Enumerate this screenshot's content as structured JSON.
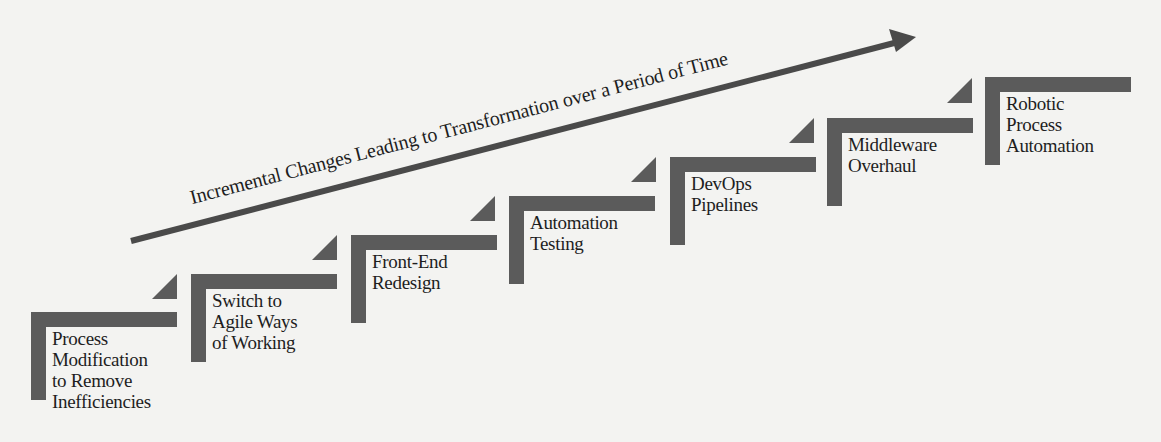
{
  "diagram": {
    "type": "staircase-progression",
    "colors": {
      "background": "#f3f3f1",
      "step_fill": "#5b5b5b",
      "arrow": "#4a4a4a",
      "text": "#1e1e1e"
    },
    "arrow": {
      "label": "Incremental Changes Leading to Transformation over a Period of Time",
      "direction": "up-right"
    },
    "steps": [
      {
        "lines": [
          "Process",
          "Modification",
          "to Remove",
          "Inefficiencies"
        ]
      },
      {
        "lines": [
          "Switch to",
          "Agile Ways",
          "of Working"
        ]
      },
      {
        "lines": [
          "Front-End",
          "Redesign"
        ]
      },
      {
        "lines": [
          "Automation",
          "Testing"
        ]
      },
      {
        "lines": [
          "DevOps",
          "Pipelines"
        ]
      },
      {
        "lines": [
          "Middleware",
          "Overhaul"
        ]
      },
      {
        "lines": [
          "Robotic",
          "Process",
          "Automation"
        ]
      }
    ]
  }
}
